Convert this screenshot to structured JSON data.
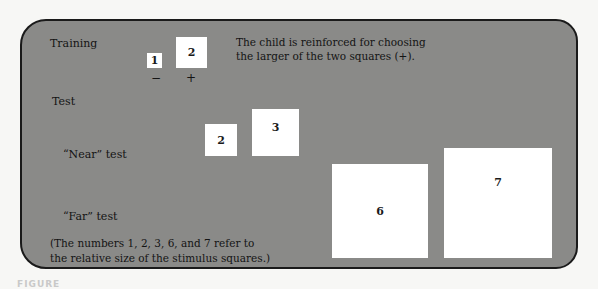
{
  "training": {
    "label": "Training",
    "small_square": "1",
    "large_square": "2",
    "minus_sign": "−",
    "plus_sign": "+",
    "description_line1": "The child is reinforced for choosing",
    "description_line2": "the larger of the two squares (+)."
  },
  "test": {
    "label": "Test",
    "near": {
      "label": "“Near” test",
      "small_square": "2",
      "large_square": "3"
    },
    "far": {
      "label": "“Far” test",
      "small_square": "6",
      "large_square": "7"
    }
  },
  "footnote": {
    "line1": "(The numbers 1, 2, 3, 6, and 7 refer to",
    "line2": "the relative size of the stimulus squares.)"
  },
  "caption": "FIGURE",
  "colors": {
    "panel": "#8a8a88",
    "square": "#ffffff",
    "border": "#1a1a1a"
  }
}
